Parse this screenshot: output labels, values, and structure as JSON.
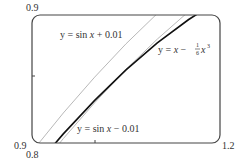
{
  "chart_data": {
    "type": "line",
    "title": "",
    "xlabel": "",
    "ylabel": "",
    "xlim": [
      0.9,
      1.2
    ],
    "ylim": [
      0.8,
      0.9
    ],
    "grid": false,
    "axis_labels": {
      "x_min": "0.9",
      "x_max": "1.2",
      "y_min": "0.8",
      "y_max": "0.9"
    },
    "series": [
      {
        "name": "y = sin x + 0.01",
        "color": "#b8b8b8",
        "x": [
          0.9,
          0.95,
          1.0,
          1.05,
          1.1,
          1.15,
          1.2
        ],
        "values": [
          0.7933,
          0.8234,
          0.8515,
          0.8775,
          0.9012,
          0.9227,
          0.942
        ]
      },
      {
        "name": "y = x - (1/6)x^3",
        "color": "#111111",
        "x": [
          0.9,
          0.95,
          1.0,
          1.05,
          1.1,
          1.15,
          1.2
        ],
        "values": [
          0.7785,
          0.8071,
          0.8333,
          0.8571,
          0.8782,
          0.8965,
          0.912
        ]
      },
      {
        "name": "y = sin x - 0.01",
        "color": "#b8b8b8",
        "x": [
          0.9,
          0.95,
          1.0,
          1.05,
          1.1,
          1.15,
          1.2
        ],
        "values": [
          0.7733,
          0.8034,
          0.8315,
          0.8575,
          0.8812,
          0.9027,
          0.922
        ]
      }
    ],
    "annotations": [
      {
        "text_prefix": "y = sin ",
        "var": "x",
        "text_suffix": " + 0.01"
      },
      {
        "text_prefix": "y = ",
        "var": "x",
        "mid": " − ",
        "frac_num": "1",
        "frac_den": "6",
        "var2": "x",
        "exp": "3"
      },
      {
        "text_prefix": "y = sin ",
        "var": "x",
        "text_suffix": " − 0.01"
      }
    ]
  }
}
